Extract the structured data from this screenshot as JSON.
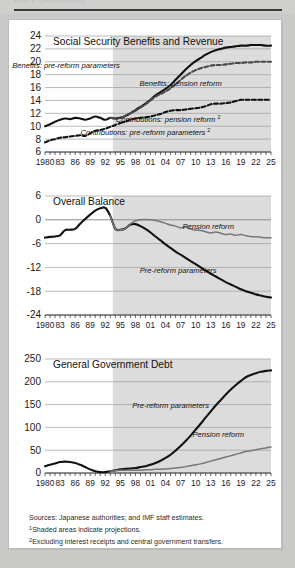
{
  "header": {
    "ghost_text": "Box 2 (concluded)"
  },
  "figure": {
    "x_axis": {
      "ticks": [
        "1980",
        "83",
        "86",
        "89",
        "92",
        "95",
        "98",
        "01",
        "04",
        "07",
        "10",
        "13",
        "16",
        "19",
        "22",
        "25"
      ],
      "start_year": 1980,
      "end_year": 2025,
      "minor_tick_step": 1
    },
    "shading": {
      "label": "projections",
      "start_year": 1993.5,
      "color": "#dcdcdc"
    }
  },
  "notes": {
    "sources": "Sources:  Japanese authorities; and IMF staff estimates.",
    "note1_marker": "1",
    "note1": "Shaded areas indicate projections.",
    "note2_marker": "2",
    "note2": "Excluding interest receipts and central government transfers."
  },
  "chart_data": [
    {
      "type": "line",
      "title": "Social Security Benefits and Revenue",
      "xlabel": "",
      "ylabel": "",
      "ylim": [
        6,
        24
      ],
      "yticks": [
        6,
        8,
        10,
        12,
        14,
        16,
        18,
        20,
        22,
        24
      ],
      "xlim": [
        1980,
        2025
      ],
      "grid": true,
      "legend_position": "inline-annotations",
      "annotations": [
        {
          "text": "Benefits: pre-reform parameters",
          "x": 1984.2,
          "y": 19.0
        },
        {
          "text": "Benefits: pension reform",
          "x": 2007.0,
          "y": 16.3
        },
        {
          "text": "Contributions: pension reform",
          "marker": "2",
          "x": 2004.0,
          "y": 10.6
        },
        {
          "text": "Contributions: pre-reform parameters",
          "marker": "2",
          "x": 1999.5,
          "y": 8.6
        }
      ],
      "series": [
        {
          "name": "Benefits: pre-reform parameters",
          "style": "solid",
          "color": "#111111",
          "x": [
            1980,
            1981,
            1982,
            1983,
            1984,
            1985,
            1986,
            1987,
            1988,
            1989,
            1990,
            1991,
            1992,
            1993,
            1994,
            1995,
            1996,
            1997,
            1998,
            1999,
            2000,
            2001,
            2002,
            2003,
            2004,
            2005,
            2006,
            2007,
            2008,
            2009,
            2010,
            2011,
            2012,
            2013,
            2014,
            2015,
            2016,
            2017,
            2018,
            2019,
            2020,
            2021,
            2022,
            2023,
            2024,
            2025
          ],
          "values": [
            10.0,
            10.3,
            10.7,
            11.0,
            11.2,
            11.1,
            11.3,
            11.2,
            11.0,
            11.2,
            11.5,
            11.3,
            11.0,
            11.3,
            11.2,
            11.3,
            11.6,
            12.0,
            12.5,
            13.0,
            13.5,
            14.1,
            14.8,
            15.3,
            15.8,
            16.4,
            17.2,
            18.0,
            18.8,
            19.5,
            20.1,
            20.6,
            21.1,
            21.5,
            21.8,
            22.0,
            22.2,
            22.3,
            22.4,
            22.5,
            22.5,
            22.6,
            22.6,
            22.6,
            22.5,
            22.5
          ]
        },
        {
          "name": "Benefits: pension reform",
          "style": "dashed",
          "color": "#4a4a4a",
          "x": [
            1993,
            1994,
            1995,
            1996,
            1997,
            1998,
            1999,
            2000,
            2001,
            2002,
            2003,
            2004,
            2005,
            2006,
            2007,
            2008,
            2009,
            2010,
            2011,
            2012,
            2013,
            2014,
            2015,
            2016,
            2017,
            2018,
            2019,
            2020,
            2021,
            2022,
            2023,
            2024,
            2025
          ],
          "values": [
            11.3,
            11.2,
            11.3,
            11.6,
            12.0,
            12.4,
            12.9,
            13.4,
            14.0,
            14.6,
            15.0,
            15.4,
            15.9,
            16.5,
            17.2,
            17.8,
            18.3,
            18.7,
            19.0,
            19.2,
            19.4,
            19.5,
            19.5,
            19.6,
            19.7,
            19.8,
            19.8,
            19.9,
            19.9,
            20.0,
            20.0,
            20.0,
            20.0
          ]
        },
        {
          "name": "Contributions: pre-reform parameters",
          "style": "dashed",
          "color": "#111111",
          "x": [
            1980,
            1981,
            1982,
            1983,
            1984,
            1985,
            1986,
            1987,
            1988,
            1989,
            1990,
            1991,
            1992,
            1993,
            1994,
            1995
          ],
          "values": [
            7.5,
            7.8,
            8.0,
            8.2,
            8.3,
            8.4,
            8.5,
            8.6,
            8.5,
            8.9,
            9.3,
            9.4,
            9.6,
            9.9,
            10.2,
            10.5
          ]
        },
        {
          "name": "Contributions: pension reform",
          "style": "dashed",
          "color": "#111111",
          "x": [
            1995,
            1996,
            1997,
            1998,
            1999,
            2000,
            2001,
            2002,
            2003,
            2004,
            2005,
            2006,
            2007,
            2008,
            2009,
            2010,
            2011,
            2012,
            2013,
            2014,
            2015,
            2016,
            2017,
            2018,
            2019,
            2020,
            2021,
            2022,
            2023,
            2024,
            2025
          ],
          "values": [
            10.5,
            10.7,
            11.0,
            11.2,
            11.3,
            11.4,
            11.5,
            11.7,
            11.9,
            12.2,
            12.4,
            12.5,
            12.5,
            12.6,
            12.7,
            12.8,
            12.9,
            13.1,
            13.4,
            13.5,
            13.5,
            13.6,
            13.7,
            13.9,
            14.1,
            14.1,
            14.1,
            14.1,
            14.1,
            14.1,
            14.1
          ]
        }
      ]
    },
    {
      "type": "line",
      "title": "Overall Balance",
      "xlabel": "",
      "ylabel": "",
      "ylim": [
        -24,
        6
      ],
      "yticks": [
        -24,
        -18,
        -12,
        -6,
        0,
        6
      ],
      "ytick_labels": [
        "-24",
        "-18",
        "-12",
        "-6",
        "0",
        "6"
      ],
      "xlim": [
        1980,
        2025
      ],
      "grid": true,
      "legend_position": "inline-annotations",
      "annotations": [
        {
          "text": "Pension reform",
          "x": 2012.5,
          "y": -2.2
        },
        {
          "text": "Pre-reform parameters",
          "x": 2006.5,
          "y": -13.3
        }
      ],
      "series": [
        {
          "name": "Pre-reform parameters",
          "style": "solid",
          "color": "#111111",
          "x": [
            1980,
            1981,
            1982,
            1983,
            1984,
            1985,
            1986,
            1987,
            1988,
            1989,
            1990,
            1991,
            1992,
            1993,
            1994,
            1995,
            1996,
            1997,
            1998,
            1999,
            2000,
            2001,
            2002,
            2003,
            2004,
            2005,
            2006,
            2007,
            2008,
            2009,
            2010,
            2011,
            2012,
            2013,
            2014,
            2015,
            2016,
            2017,
            2018,
            2019,
            2020,
            2021,
            2022,
            2023,
            2024,
            2025
          ],
          "values": [
            -4.5,
            -4.3,
            -4.2,
            -3.9,
            -2.6,
            -2.5,
            -2.3,
            -1.0,
            0.2,
            1.3,
            2.3,
            2.9,
            3.0,
            1.0,
            -2.3,
            -2.5,
            -2.2,
            -1.2,
            -1.1,
            -1.6,
            -2.3,
            -3.2,
            -4.2,
            -5.2,
            -6.2,
            -7.1,
            -8.0,
            -8.8,
            -9.6,
            -10.4,
            -11.2,
            -12.0,
            -12.8,
            -13.6,
            -14.3,
            -15.0,
            -15.7,
            -16.3,
            -16.9,
            -17.5,
            -18.0,
            -18.4,
            -18.8,
            -19.1,
            -19.4,
            -19.6
          ]
        },
        {
          "name": "Pension reform",
          "style": "solid",
          "color": "#777777",
          "x": [
            1993,
            1994,
            1995,
            1996,
            1997,
            1998,
            1999,
            2000,
            2001,
            2002,
            2003,
            2004,
            2005,
            2006,
            2007,
            2008,
            2009,
            2010,
            2011,
            2012,
            2013,
            2014,
            2015,
            2016,
            2017,
            2018,
            2019,
            2020,
            2021,
            2022,
            2023,
            2024,
            2025
          ],
          "values": [
            1.0,
            -2.3,
            -2.5,
            -2.2,
            -1.0,
            -0.3,
            0.0,
            0.1,
            0.0,
            -0.2,
            -0.5,
            -0.9,
            -1.3,
            -1.6,
            -2.0,
            -1.9,
            -2.3,
            -2.6,
            -2.7,
            -3.0,
            -3.3,
            -3.1,
            -3.4,
            -3.7,
            -3.6,
            -3.9,
            -3.7,
            -4.0,
            -4.2,
            -4.3,
            -4.4,
            -4.5,
            -4.5
          ]
        }
      ]
    },
    {
      "type": "line",
      "title": "General Government Debt",
      "xlabel": "",
      "ylabel": "",
      "ylim": [
        0,
        250
      ],
      "yticks": [
        0,
        50,
        100,
        150,
        200,
        250
      ],
      "xlim": [
        1980,
        2025
      ],
      "grid": true,
      "legend_position": "inline-annotations",
      "annotations": [
        {
          "text": "Pre-reform parameters",
          "x": 2005.0,
          "y": 142
        },
        {
          "text": "Pension reform",
          "x": 2014.5,
          "y": 78
        }
      ],
      "series": [
        {
          "name": "Pre-reform parameters",
          "style": "solid",
          "color": "#111111",
          "x": [
            1980,
            1981,
            1982,
            1983,
            1984,
            1985,
            1986,
            1987,
            1988,
            1989,
            1990,
            1991,
            1992,
            1993,
            1994,
            1995,
            1996,
            1997,
            1998,
            1999,
            2000,
            2001,
            2002,
            2003,
            2004,
            2005,
            2006,
            2007,
            2008,
            2009,
            2010,
            2011,
            2012,
            2013,
            2014,
            2015,
            2016,
            2017,
            2018,
            2019,
            2020,
            2021,
            2022,
            2023,
            2024,
            2025
          ],
          "values": [
            15,
            18,
            21,
            24,
            25,
            24,
            22,
            18,
            13,
            8,
            4,
            2,
            2,
            4,
            6,
            8,
            9,
            10,
            11,
            13,
            15,
            18,
            22,
            27,
            33,
            40,
            49,
            59,
            70,
            82,
            95,
            108,
            122,
            135,
            148,
            160,
            172,
            183,
            193,
            202,
            210,
            215,
            219,
            222,
            224,
            225
          ]
        },
        {
          "name": "Pension reform",
          "style": "solid",
          "color": "#777777",
          "x": [
            1993,
            1994,
            1995,
            1996,
            1997,
            1998,
            1999,
            2000,
            2001,
            2002,
            2003,
            2004,
            2005,
            2006,
            2007,
            2008,
            2009,
            2010,
            2011,
            2012,
            2013,
            2014,
            2015,
            2016,
            2017,
            2018,
            2019,
            2020,
            2021,
            2022,
            2023,
            2024,
            2025
          ],
          "values": [
            4,
            5,
            6,
            6,
            6,
            6,
            6,
            7,
            7,
            8,
            8,
            9,
            10,
            11,
            12,
            14,
            16,
            18,
            20,
            23,
            26,
            29,
            32,
            35,
            38,
            41,
            44,
            47,
            49,
            51,
            53,
            55,
            57
          ]
        }
      ]
    }
  ]
}
